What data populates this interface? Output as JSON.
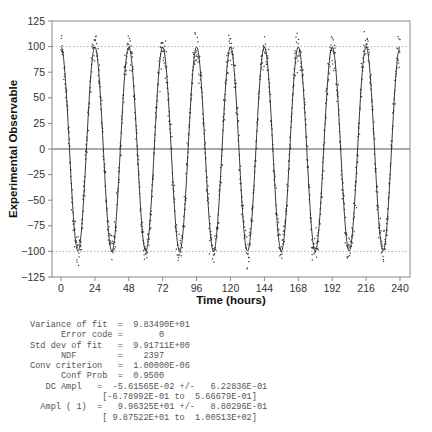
{
  "chart_data": {
    "type": "scatter",
    "title": "",
    "xlabel": "Time (hours)",
    "ylabel": "Experimental Observable",
    "xlim": [
      -4,
      244
    ],
    "ylim": [
      -125,
      125
    ],
    "x_ticks": [
      0,
      24,
      48,
      72,
      96,
      120,
      144,
      168,
      192,
      216,
      240
    ],
    "y_ticks": [
      -125,
      -100,
      -75,
      -50,
      -25,
      0,
      25,
      50,
      75,
      100,
      125
    ],
    "reference_lines": [
      {
        "y": 100,
        "style": "dotted"
      },
      {
        "y": -100,
        "style": "dotted"
      },
      {
        "y": 0,
        "style": "solid"
      }
    ],
    "grid": false,
    "legend": null,
    "series": [
      {
        "name": "data",
        "kind": "scatter",
        "n_points": 2400,
        "noise_sd": 9.917,
        "description": "noisy cosine samples"
      },
      {
        "name": "fit",
        "kind": "line",
        "model": "DC + A*cos(2*pi*t/24)",
        "dc": -0.0561565,
        "amplitude": 99.6325,
        "period_hours": 24
      }
    ]
  },
  "stats": {
    "lines": [
      "Variance of fit  =  9.83490E+01",
      "      Error code =       0",
      "Std dev of fit   =  9.91711E+00",
      "      NDF        =    2397",
      "Conv criterion   =  1.00000E-06",
      "      Conf Prob  =  0.9500",
      "   DC Ampl   =  -5.61565E-02 +/-   6.22836E-01",
      "              [-6.78992E-01 to  5.66679E-01]",
      "  Ampl ( 1)  =   9.96325E+01 +/-   8.80296E-01",
      "              [ 9.87522E+01 to  1.00513E+02]"
    ]
  }
}
